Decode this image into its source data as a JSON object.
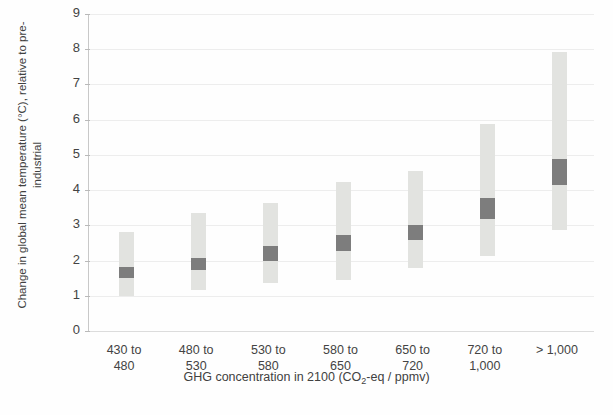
{
  "chart_data": {
    "type": "bar",
    "title": "",
    "xlabel": "GHG concentration in 2100 (CO₂-eq / ppmv)",
    "xlabel_parts": {
      "pre": "GHG concentration in 2100 (CO",
      "sub": "2",
      "post": "-eq / ppmv)"
    },
    "ylabel": "Change in global mean temperature (°C), relative to pre-industrial",
    "ylim": [
      0,
      9
    ],
    "yticks": [
      0,
      1,
      2,
      3,
      4,
      5,
      6,
      7,
      8,
      9
    ],
    "ytick_labels": [
      "0",
      "1",
      "2",
      "3",
      "4",
      "5",
      "6",
      "7",
      "8",
      "9"
    ],
    "grid": true,
    "legend": "none",
    "categories": [
      "430 to 480",
      "480 to 530",
      "530 to 580",
      "580 to 650",
      "650 to 720",
      "720 to 1,000",
      "> 1,000"
    ],
    "category_lines": [
      [
        "430 to",
        "480"
      ],
      [
        "480 to",
        "530"
      ],
      [
        "530 to",
        "580"
      ],
      [
        "580 to",
        "650"
      ],
      [
        "650 to",
        "720"
      ],
      [
        "720 to",
        "1,000"
      ],
      [
        "> 1,000",
        ""
      ]
    ],
    "series": [
      {
        "name": "Full range (light band)",
        "color": "#e2e3e0",
        "low": [
          1.0,
          1.15,
          1.37,
          1.45,
          1.8,
          2.13,
          2.87
        ],
        "high": [
          2.82,
          3.35,
          3.63,
          4.22,
          4.55,
          5.88,
          7.92
        ]
      },
      {
        "name": "Likely range (dark band)",
        "color": "#7d7d7d",
        "low": [
          1.5,
          1.73,
          2.0,
          2.28,
          2.58,
          3.18,
          4.15
        ],
        "high": [
          1.82,
          2.08,
          2.4,
          2.72,
          3.0,
          3.78,
          4.88
        ]
      }
    ]
  }
}
